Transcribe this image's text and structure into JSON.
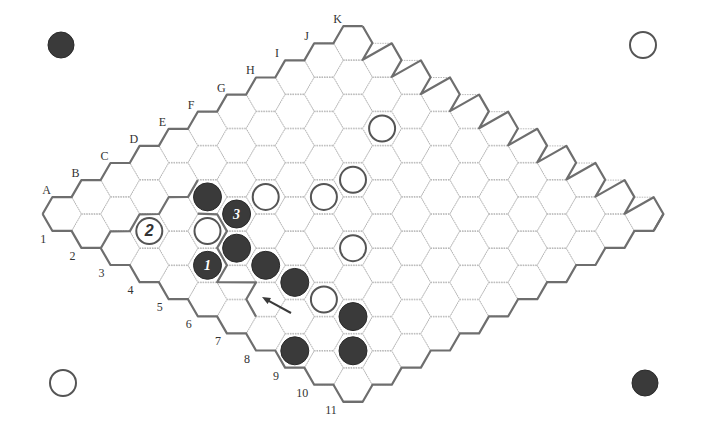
{
  "board": {
    "size": 11,
    "column_labels": [
      "A",
      "B",
      "C",
      "D",
      "E",
      "F",
      "G",
      "H",
      "I",
      "J",
      "K"
    ],
    "row_labels": [
      "1",
      "2",
      "3",
      "4",
      "5",
      "6",
      "7",
      "8",
      "9",
      "10",
      "11"
    ],
    "colors": {
      "black_stone": "#3a3a3a",
      "white_stone_outline": "#555555",
      "grid_line": "#b8b8b8",
      "border_line": "#6e6e6e"
    },
    "stones": [
      {
        "cell": "D3",
        "color": "black",
        "label": ""
      },
      {
        "cell": "D4",
        "color": "black",
        "label": "3"
      },
      {
        "cell": "C5",
        "color": "black",
        "label": ""
      },
      {
        "cell": "B5",
        "color": "black",
        "label": "1"
      },
      {
        "cell": "C6",
        "color": "black",
        "label": ""
      },
      {
        "cell": "C7",
        "color": "black",
        "label": ""
      },
      {
        "cell": "C9",
        "color": "black",
        "label": ""
      },
      {
        "cell": "A9",
        "color": "black",
        "label": ""
      },
      {
        "cell": "B10",
        "color": "black",
        "label": ""
      },
      {
        "cell": "B3",
        "color": "white",
        "label": "2"
      },
      {
        "cell": "C4",
        "color": "white",
        "label": ""
      },
      {
        "cell": "E4",
        "color": "white",
        "label": ""
      },
      {
        "cell": "F5",
        "color": "white",
        "label": ""
      },
      {
        "cell": "G5",
        "color": "white",
        "label": ""
      },
      {
        "cell": "E7",
        "color": "white",
        "label": ""
      },
      {
        "cell": "I4",
        "color": "white",
        "label": ""
      },
      {
        "cell": "C8",
        "color": "white",
        "label": ""
      }
    ],
    "corner_stones": [
      {
        "position": "top-left",
        "color": "black",
        "x": 61,
        "y": 45
      },
      {
        "position": "top-right",
        "color": "white",
        "x": 643,
        "y": 45
      },
      {
        "position": "bottom-left",
        "color": "white",
        "x": 63,
        "y": 383
      },
      {
        "position": "bottom-right",
        "color": "black",
        "x": 645,
        "y": 383
      }
    ],
    "arrow": {
      "from": [
        291,
        313
      ],
      "to": [
        262,
        297
      ],
      "points_at": "B7"
    }
  }
}
